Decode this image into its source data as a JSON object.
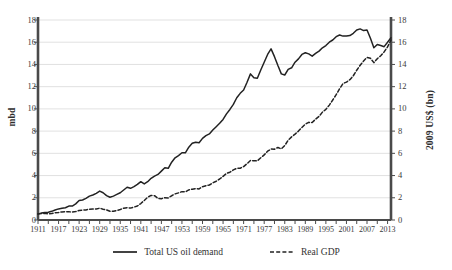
{
  "chart_data": {
    "type": "line",
    "title": "",
    "xlabel": "",
    "ylabel": "mbd",
    "ylabel_right": "2009 US$ (bn)",
    "xlim": [
      1911,
      2014
    ],
    "ylim": [
      0,
      18
    ],
    "ylim_right": [
      0,
      18
    ],
    "grid": "horizontal",
    "legend_position": "bottom",
    "yticks": [
      0,
      2,
      4,
      6,
      8,
      10,
      12,
      14,
      16,
      18
    ],
    "yticks_right": [
      0,
      2,
      4,
      6,
      8,
      10,
      12,
      14,
      16,
      18
    ],
    "xticks": [
      1911,
      1917,
      1923,
      1929,
      1935,
      1941,
      1947,
      1953,
      1959,
      1965,
      1971,
      1977,
      1983,
      1989,
      1995,
      2001,
      2007,
      2013
    ],
    "x": [
      1911,
      1912,
      1913,
      1914,
      1915,
      1916,
      1917,
      1918,
      1919,
      1920,
      1921,
      1922,
      1923,
      1924,
      1925,
      1926,
      1927,
      1928,
      1929,
      1930,
      1931,
      1932,
      1933,
      1934,
      1935,
      1936,
      1937,
      1938,
      1939,
      1940,
      1941,
      1942,
      1943,
      1944,
      1945,
      1946,
      1947,
      1948,
      1949,
      1950,
      1951,
      1952,
      1953,
      1954,
      1955,
      1956,
      1957,
      1958,
      1959,
      1960,
      1961,
      1962,
      1963,
      1964,
      1965,
      1966,
      1967,
      1968,
      1969,
      1970,
      1971,
      1972,
      1973,
      1974,
      1975,
      1976,
      1977,
      1978,
      1979,
      1980,
      1981,
      1982,
      1983,
      1984,
      1985,
      1986,
      1987,
      1988,
      1989,
      1990,
      1991,
      1992,
      1993,
      1994,
      1995,
      1996,
      1997,
      1998,
      1999,
      2000,
      2001,
      2002,
      2003,
      2004,
      2005,
      2006,
      2007,
      2008,
      2009,
      2010,
      2011,
      2012,
      2013,
      2014
    ],
    "series": [
      {
        "name": "Total US oil demand",
        "style": "solid",
        "color": "#222222",
        "unit": "mbd",
        "axis": "left",
        "values": [
          0.55,
          0.62,
          0.68,
          0.7,
          0.78,
          0.9,
          1.0,
          1.05,
          1.1,
          1.25,
          1.25,
          1.45,
          1.75,
          1.8,
          1.95,
          2.15,
          2.25,
          2.4,
          2.6,
          2.45,
          2.2,
          2.05,
          2.15,
          2.3,
          2.45,
          2.7,
          2.95,
          2.85,
          3.0,
          3.2,
          3.45,
          3.25,
          3.45,
          3.75,
          3.95,
          4.1,
          4.4,
          4.7,
          4.65,
          5.2,
          5.6,
          5.8,
          6.05,
          6.05,
          6.55,
          6.9,
          7.0,
          6.95,
          7.35,
          7.6,
          7.75,
          8.1,
          8.4,
          8.7,
          9.05,
          9.55,
          9.95,
          10.4,
          11.0,
          11.4,
          11.7,
          12.4,
          13.15,
          12.8,
          12.75,
          13.5,
          14.2,
          14.9,
          15.4,
          14.7,
          13.9,
          13.15,
          13.05,
          13.55,
          13.7,
          14.2,
          14.5,
          14.9,
          15.05,
          14.95,
          14.75,
          15.0,
          15.2,
          15.5,
          15.7,
          16.0,
          16.2,
          16.5,
          16.65,
          16.55,
          16.55,
          16.6,
          16.8,
          17.1,
          17.2,
          17.05,
          17.1,
          16.35,
          15.5,
          15.8,
          15.7,
          15.6,
          16.0,
          16.4
        ]
      },
      {
        "name": "Real GDP",
        "style": "dashed",
        "color": "#222222",
        "unit": "2009 US$ (bn)",
        "axis": "right",
        "values": [
          0.55,
          0.58,
          0.6,
          0.56,
          0.58,
          0.66,
          0.67,
          0.73,
          0.74,
          0.74,
          0.72,
          0.76,
          0.86,
          0.89,
          0.91,
          0.97,
          0.98,
          0.99,
          1.06,
          0.97,
          0.91,
          0.79,
          0.78,
          0.86,
          0.94,
          1.06,
          1.11,
          1.07,
          1.16,
          1.26,
          1.48,
          1.76,
          2.05,
          2.21,
          2.19,
          1.94,
          1.92,
          2.0,
          1.99,
          2.18,
          2.35,
          2.44,
          2.55,
          2.53,
          2.71,
          2.77,
          2.83,
          2.8,
          3.0,
          3.08,
          3.15,
          3.34,
          3.49,
          3.69,
          3.93,
          4.19,
          4.3,
          4.51,
          4.65,
          4.66,
          4.81,
          5.07,
          5.36,
          5.33,
          5.32,
          5.6,
          5.86,
          6.19,
          6.39,
          6.37,
          6.53,
          6.4,
          6.7,
          7.18,
          7.48,
          7.73,
          8.0,
          8.33,
          8.63,
          8.79,
          8.77,
          9.08,
          9.33,
          9.71,
          9.96,
          10.34,
          10.8,
          11.28,
          11.81,
          12.29,
          12.41,
          12.63,
          12.98,
          13.48,
          13.93,
          14.31,
          14.63,
          14.56,
          14.16,
          14.52,
          14.78,
          15.13,
          15.58,
          16.2
        ]
      }
    ]
  },
  "axes": {
    "left_title": "mbd",
    "right_title": "2009 US$ (bn)",
    "ytick_labels": [
      "18",
      "16",
      "14",
      "12",
      "10",
      "8",
      "6",
      "4",
      "2",
      "0"
    ],
    "ytick_labels_right": [
      "18",
      "16",
      "14",
      "12",
      "10",
      "8",
      "6",
      "4",
      "2",
      "0"
    ],
    "xtick_labels": [
      "1911",
      "1917",
      "1923",
      "1929",
      "1935",
      "1941",
      "1947",
      "1953",
      "1959",
      "1965",
      "1971",
      "1977",
      "1983",
      "1989",
      "1995",
      "2001",
      "2007",
      "2013"
    ]
  },
  "legend": {
    "items": [
      {
        "label": "Total US oil demand",
        "style": "solid"
      },
      {
        "label": "Real GDP",
        "style": "dashed"
      }
    ]
  },
  "colors": {
    "line": "#222222",
    "spine": "#4a4a4a",
    "grid": "#d9d9d9",
    "text": "#3a3a3a",
    "background": "#ffffff"
  }
}
